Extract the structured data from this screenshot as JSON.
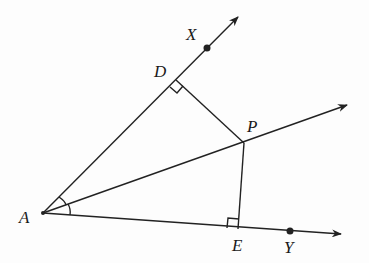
{
  "diagram": {
    "type": "angle-bisector-construction",
    "points": {
      "A": {
        "label": "A",
        "x": 43,
        "y": 213
      },
      "D": {
        "label": "D",
        "x": 176,
        "y": 80
      },
      "X": {
        "label": "X",
        "x": 207,
        "y": 48
      },
      "P": {
        "label": "P",
        "x": 244,
        "y": 143
      },
      "E": {
        "label": "E",
        "x": 238,
        "y": 229
      },
      "Y": {
        "label": "Y",
        "x": 290,
        "y": 231
      }
    },
    "rays": [
      {
        "name": "ray-AX",
        "from": "A",
        "through": "X"
      },
      {
        "name": "ray-AP",
        "from": "A",
        "through": "P"
      },
      {
        "name": "ray-AY",
        "from": "A",
        "through": "Y"
      }
    ],
    "segments": [
      {
        "name": "segment-PD",
        "from": "P",
        "to": "D"
      },
      {
        "name": "segment-PE",
        "from": "P",
        "to": "E"
      }
    ],
    "right_angles": [
      "D",
      "E"
    ],
    "congruent_angle_marks": [
      "XAP",
      "PAY"
    ],
    "line_color": "#222222"
  }
}
